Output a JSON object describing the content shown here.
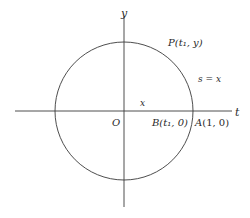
{
  "diagram": {
    "type": "unit-circle",
    "axes": {
      "horizontal_label": "t",
      "vertical_label": "y"
    },
    "origin_label": "O",
    "points": {
      "P": {
        "name": "P",
        "coords": "(t₁, y)"
      },
      "B": {
        "name": "B",
        "coords": "(t₁, 0)"
      },
      "A": {
        "name": "A",
        "coords": "(1, 0)"
      }
    },
    "annotations": {
      "arc": "s = x",
      "segment": "x"
    },
    "colors": {
      "stroke": "#3a3a3a",
      "text": "#2a2a2a",
      "background": "#ffffff"
    }
  }
}
